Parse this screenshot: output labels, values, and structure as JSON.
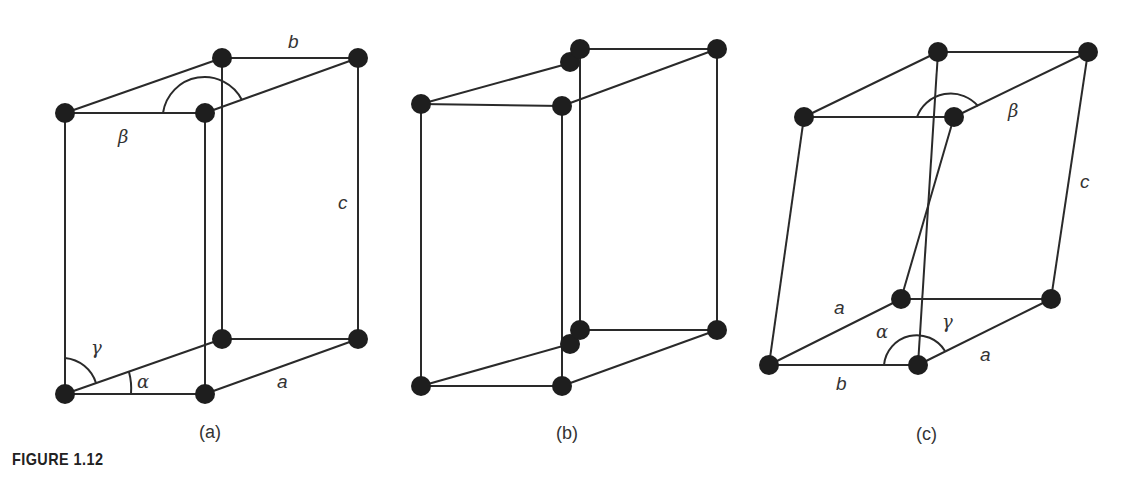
{
  "figure": {
    "label": "FIGURE 1.12",
    "panels": [
      {
        "id": "a",
        "caption": "(a)",
        "labels": {
          "b": "b",
          "c": "c",
          "a": "a",
          "beta": "β",
          "gamma": "γ",
          "alpha": "α"
        }
      },
      {
        "id": "b",
        "caption": "(b)",
        "labels": {}
      },
      {
        "id": "c",
        "caption": "(c)",
        "labels": {
          "beta": "β",
          "c": "c",
          "a_left": "a",
          "a_right": "a",
          "b": "b",
          "alpha": "α",
          "gamma": "γ"
        }
      }
    ]
  },
  "colors": {
    "line": "#2a2a2a",
    "atom": "#1e1e1e",
    "text": "#333333"
  }
}
